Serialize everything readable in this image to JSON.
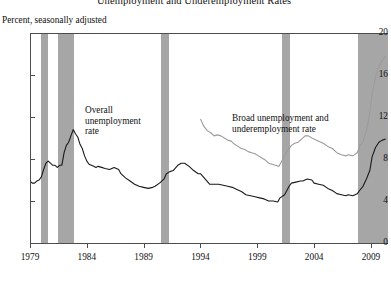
{
  "chart_data": {
    "type": "line",
    "title": "Unemployment and Underemployment Rates",
    "subtitle": "Percent, seasonally adjusted",
    "xlabel": "",
    "ylabel": "Percent, seasonally adjusted",
    "ylim": [
      0,
      20
    ],
    "xlim": [
      1979,
      2010.5
    ],
    "yticks": [
      0,
      4,
      8,
      12,
      16,
      20
    ],
    "ytick_labels": [
      "0",
      "4",
      "8",
      "12",
      "16",
      "20"
    ],
    "xticks": [
      1979,
      1984,
      1989,
      1994,
      1999,
      2004,
      2009
    ],
    "xtick_labels": [
      "1979",
      "1984",
      "1989",
      "1994",
      "1999",
      "2004",
      "2009"
    ],
    "grid": false,
    "legend": "annotations",
    "annotations": [
      {
        "name": "overall-unemployment-label",
        "text_line1": "Overall",
        "text_line2": "unemployment",
        "text_line3": "rate",
        "x": 1984.6,
        "y": 9.4
      },
      {
        "name": "broad-unemployment-label",
        "text_line1": "Broad unemployment and",
        "text_line2": "underemployment rate",
        "x": 1997.5,
        "y": 8.9
      }
    ],
    "shaded_regions": {
      "name": "recession-bands",
      "color": "#a6a6a6",
      "spans": [
        {
          "start": 1980.0,
          "end": 1980.6
        },
        {
          "start": 1981.5,
          "end": 1982.9
        },
        {
          "start": 1990.5,
          "end": 1991.2
        },
        {
          "start": 2001.2,
          "end": 2001.9
        },
        {
          "start": 2007.9,
          "end": 2010.5
        }
      ]
    },
    "series": [
      {
        "name": "Overall unemployment rate",
        "color": "#1a1a1a",
        "x": [
          1979.0,
          1979.2,
          1979.4,
          1979.6,
          1979.8,
          1980.0,
          1980.2,
          1980.4,
          1980.6,
          1980.8,
          1981.0,
          1981.2,
          1981.4,
          1981.6,
          1981.8,
          1982.0,
          1982.2,
          1982.4,
          1982.6,
          1982.8,
          1983.0,
          1983.2,
          1983.4,
          1983.6,
          1983.8,
          1984.0,
          1984.2,
          1984.4,
          1984.6,
          1984.8,
          1985.0,
          1985.3,
          1985.6,
          1986.0,
          1986.4,
          1986.8,
          1987.0,
          1987.4,
          1987.8,
          1988.2,
          1988.6,
          1989.0,
          1989.4,
          1989.8,
          1990.0,
          1990.4,
          1990.8,
          1991.0,
          1991.3,
          1991.6,
          1992.0,
          1992.3,
          1992.6,
          1993.0,
          1993.4,
          1993.8,
          1994.0,
          1994.4,
          1994.8,
          1995.2,
          1995.6,
          1996.0,
          1996.4,
          1996.8,
          1997.2,
          1997.6,
          1998.0,
          1998.4,
          1998.8,
          1999.2,
          1999.6,
          2000.0,
          2000.4,
          2000.8,
          2001.0,
          2001.4,
          2001.8,
          2002.0,
          2002.4,
          2002.8,
          2003.0,
          2003.4,
          2003.8,
          2004.0,
          2004.4,
          2004.8,
          2005.2,
          2005.6,
          2006.0,
          2006.4,
          2006.8,
          2007.0,
          2007.4,
          2007.8,
          2008.0,
          2008.3,
          2008.6,
          2008.9,
          2009.1,
          2009.4,
          2009.7,
          2010.0,
          2010.3
        ],
        "y": [
          5.9,
          5.7,
          5.7,
          5.9,
          6.0,
          6.3,
          7.0,
          7.6,
          7.8,
          7.6,
          7.4,
          7.4,
          7.2,
          7.4,
          7.4,
          8.6,
          9.3,
          9.6,
          10.2,
          10.8,
          10.4,
          10.1,
          9.4,
          9.0,
          8.3,
          7.8,
          7.5,
          7.4,
          7.3,
          7.2,
          7.3,
          7.2,
          7.1,
          7.0,
          7.2,
          7.0,
          6.6,
          6.2,
          5.9,
          5.6,
          5.4,
          5.3,
          5.2,
          5.3,
          5.4,
          5.7,
          6.1,
          6.6,
          6.8,
          6.9,
          7.4,
          7.6,
          7.6,
          7.3,
          6.9,
          6.6,
          6.6,
          6.1,
          5.6,
          5.6,
          5.6,
          5.5,
          5.4,
          5.3,
          5.1,
          4.9,
          4.6,
          4.5,
          4.4,
          4.3,
          4.2,
          4.0,
          4.0,
          3.9,
          4.3,
          4.6,
          5.4,
          5.7,
          5.8,
          5.9,
          5.9,
          6.1,
          6.0,
          5.7,
          5.6,
          5.5,
          5.2,
          5.0,
          4.7,
          4.6,
          4.5,
          4.6,
          4.5,
          4.7,
          5.0,
          5.4,
          6.1,
          6.9,
          8.2,
          9.1,
          9.6,
          9.8,
          9.9
        ]
      },
      {
        "name": "Broad unemployment and underemployment rate",
        "color": "#9b9b9b",
        "x": [
          1994.0,
          1994.3,
          1994.6,
          1994.9,
          1995.2,
          1995.5,
          1995.8,
          1996.1,
          1996.4,
          1996.7,
          1997.0,
          1997.3,
          1997.6,
          1997.9,
          1998.2,
          1998.5,
          1998.8,
          1999.1,
          1999.4,
          1999.7,
          2000.0,
          2000.3,
          2000.6,
          2000.9,
          2001.1,
          2001.4,
          2001.7,
          2002.0,
          2002.3,
          2002.6,
          2002.9,
          2003.2,
          2003.5,
          2003.8,
          2004.0,
          2004.4,
          2004.8,
          2005.2,
          2005.6,
          2006.0,
          2006.4,
          2006.8,
          2007.0,
          2007.4,
          2007.8,
          2008.0,
          2008.3,
          2008.6,
          2008.9,
          2009.1,
          2009.4,
          2009.7,
          2010.0,
          2010.3
        ],
        "y": [
          11.8,
          11.1,
          10.7,
          10.5,
          10.2,
          10.3,
          10.2,
          10.0,
          9.8,
          9.7,
          9.4,
          9.2,
          9.0,
          8.9,
          8.7,
          8.6,
          8.5,
          8.3,
          8.1,
          7.9,
          7.6,
          7.5,
          7.4,
          7.3,
          7.7,
          8.3,
          8.9,
          9.3,
          9.5,
          9.6,
          9.9,
          10.2,
          10.2,
          10.0,
          9.9,
          9.7,
          9.5,
          9.2,
          9.0,
          8.6,
          8.4,
          8.3,
          8.4,
          8.3,
          8.6,
          9.2,
          9.6,
          10.7,
          12.4,
          14.2,
          15.8,
          16.8,
          17.4,
          17.8
        ]
      }
    ]
  },
  "axes": {
    "y_title": "Percent, seasonally adjusted"
  }
}
